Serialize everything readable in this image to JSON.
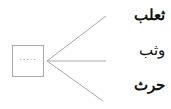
{
  "diagram": {
    "blank_box": {
      "placeholder": "....."
    },
    "branches": [
      {
        "label": "ثعلب"
      },
      {
        "label": "وثب"
      },
      {
        "label": "حرث"
      }
    ],
    "colors": {
      "lines": "#aaaaaa",
      "text": "#111111"
    }
  }
}
